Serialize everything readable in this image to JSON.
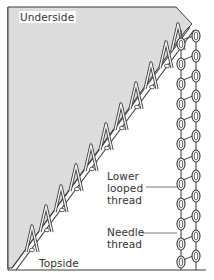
{
  "diagram": {
    "labels": {
      "underside": "Underside",
      "topside": "Topside",
      "lower_looped_thread": [
        "Lower",
        "looped",
        "thread"
      ],
      "needle_thread": [
        "Needle",
        "thread"
      ]
    },
    "colors": {
      "fabric_fill": "#dcdcdc",
      "line": "#3a3a3a",
      "background": "#ffffff",
      "text": "#333333"
    }
  }
}
